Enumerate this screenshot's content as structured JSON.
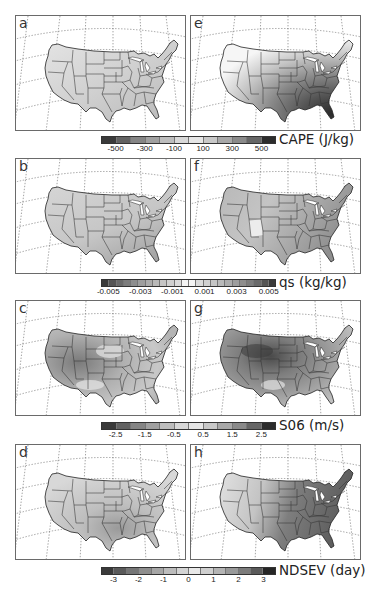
{
  "chart_data": [
    {
      "type": "heatmap",
      "title": "CAPE change maps over CONUS",
      "panels": [
        {
          "label": "a",
          "variable": "CAPE",
          "pattern": "weak positive change, slightly higher in south-central US and Florida"
        },
        {
          "label": "e",
          "variable": "CAPE",
          "pattern": "strong positive change increasing toward the southeast; maximum (>500) along Gulf Coast and Southeast"
        }
      ],
      "colorbar": {
        "label": "CAPE (J/kg)",
        "ticks": [
          "-500",
          "-300",
          "-100",
          "100",
          "300",
          "500"
        ],
        "range": [
          -600,
          600
        ],
        "n_bins": 12
      }
    },
    {
      "type": "heatmap",
      "title": "qs change maps over CONUS",
      "panels": [
        {
          "label": "b",
          "variable": "qs",
          "pattern": "small positive change, larger in south-central US and Gulf Coast"
        },
        {
          "label": "f",
          "variable": "qs",
          "pattern": "positive change over most of US, larger in the east and southeast; lowest over Southwest (New Mexico)"
        }
      ],
      "colorbar": {
        "label": "qs (kg/kg)",
        "ticks": [
          "-0.005",
          "-0.003",
          "-0.001",
          "0.001",
          "0.003",
          "0.005"
        ],
        "range": [
          -0.006,
          0.006
        ],
        "n_bins": 24
      }
    },
    {
      "type": "heatmap",
      "title": "S06 change maps over CONUS",
      "panels": [
        {
          "label": "c",
          "variable": "S06",
          "pattern": "negative change over West/Great Basin, near-zero over northern plains and southern plains"
        },
        {
          "label": "g",
          "variable": "S06",
          "pattern": "strong negative change over northern Rockies / Wyoming-Montana, moderate negative across the rest"
        }
      ],
      "colorbar": {
        "label": "S06 (m/s)",
        "ticks": [
          "-2.5",
          "-1.5",
          "-0.5",
          "0.5",
          "1.5",
          "2.5"
        ],
        "range": [
          -3,
          3
        ],
        "n_bins": 12
      }
    },
    {
      "type": "heatmap",
      "title": "NDSEV change maps over CONUS",
      "panels": [
        {
          "label": "d",
          "variable": "NDSEV",
          "pattern": "small positive change with maximum over Oklahoma / Texas / Kansas"
        },
        {
          "label": "h",
          "variable": "NDSEV",
          "pattern": "positive change increasing eastward; maximum over Midwest, Mississippi Valley, and East"
        }
      ],
      "colorbar": {
        "label": "NDSEV (day)",
        "ticks": [
          "-3",
          "-2",
          "-1",
          "0",
          "1",
          "2",
          "3"
        ],
        "range": [
          -3.5,
          3.5
        ],
        "n_bins": 14
      }
    }
  ],
  "rows": [
    {
      "left": {
        "label": "a"
      },
      "right": {
        "label": "e"
      },
      "colorbar": {
        "label": "CAPE (J/kg)",
        "ticks": [
          "-500",
          "-300",
          "-100",
          "100",
          "300",
          "500"
        ],
        "segments": 12,
        "colors": [
          "#3a3a3a",
          "#626262",
          "#858585",
          "#a0a0a0",
          "#bdbdbd",
          "#d8d8d8",
          "#e6e6e6",
          "#c8c8c8",
          "#a8a8a8",
          "#8a8a8a",
          "#666666",
          "#2c2c2c"
        ]
      }
    },
    {
      "left": {
        "label": "b"
      },
      "right": {
        "label": "f"
      },
      "colorbar": {
        "label": "qs (kg/kg)",
        "ticks": [
          "-0.005",
          "-0.003",
          "-0.001",
          "0.001",
          "0.003",
          "0.005"
        ],
        "segments": 24,
        "colors": [
          "#3a3a3a",
          "#555555",
          "#6a6a6a",
          "#7d7d7d",
          "#8e8e8e",
          "#9e9e9e",
          "#acacac",
          "#b9b9b9",
          "#c5c5c5",
          "#d0d0d0",
          "#dbdbdb",
          "#f4f4f4",
          "#f4f4f4",
          "#dbdbdb",
          "#d0d0d0",
          "#c5c5c5",
          "#b9b9b9",
          "#acacac",
          "#9e9e9e",
          "#8e8e8e",
          "#7d7d7d",
          "#6a6a6a",
          "#555555",
          "#3a3a3a"
        ]
      }
    },
    {
      "left": {
        "label": "c"
      },
      "right": {
        "label": "g"
      },
      "colorbar": {
        "label": "S06 (m/s)",
        "ticks": [
          "-2.5",
          "-1.5",
          "-0.5",
          "0.5",
          "1.5",
          "2.5"
        ],
        "segments": 12,
        "colors": [
          "#3a3a3a",
          "#626262",
          "#858585",
          "#a0a0a0",
          "#bdbdbd",
          "#d8d8d8",
          "#e6e6e6",
          "#c8c8c8",
          "#a8a8a8",
          "#8a8a8a",
          "#666666",
          "#2c2c2c"
        ]
      }
    },
    {
      "left": {
        "label": "d"
      },
      "right": {
        "label": "h"
      },
      "colorbar": {
        "label": "NDSEV (day)",
        "ticks": [
          "-3",
          "-2",
          "-1",
          "0",
          "1",
          "2",
          "3"
        ],
        "segments": 14,
        "colors": [
          "#3a3a3a",
          "#5a5a5a",
          "#767676",
          "#8e8e8e",
          "#a6a6a6",
          "#bcbcbc",
          "#d4d4d4",
          "#e8e8e8",
          "#cfcfcf",
          "#b4b4b4",
          "#999999",
          "#7c7c7c",
          "#5a5a5a",
          "#262626"
        ]
      }
    }
  ]
}
